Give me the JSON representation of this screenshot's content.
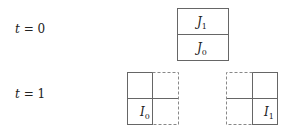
{
  "rows": [
    {
      "var": "t",
      "eq": " = ",
      "value": "0"
    },
    {
      "var": "t",
      "eq": " = ",
      "value": "1"
    }
  ],
  "top_stack": {
    "upper": {
      "letter": "J",
      "sub": "1"
    },
    "lower": {
      "letter": "J",
      "sub": "0"
    }
  },
  "left_grid": {
    "letter": "I",
    "sub": "0"
  },
  "right_grid": {
    "letter": "I",
    "sub": "1"
  },
  "colors": {
    "line": "#666666",
    "dashed": "#888888"
  }
}
